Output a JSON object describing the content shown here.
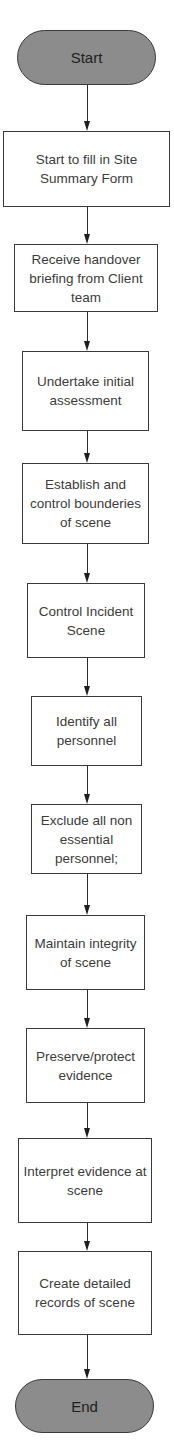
{
  "diagram": {
    "type": "flowchart",
    "direction": "top-to-bottom",
    "colors": {
      "terminator_fill": "#8c8c8c",
      "process_fill": "#ffffff",
      "stroke": "#3a3a3a",
      "text": "#3c3c3c"
    },
    "nodes": [
      {
        "id": "start",
        "shape": "terminator",
        "label": "Start"
      },
      {
        "id": "step1",
        "shape": "process",
        "label": "Start to fill in Site Summary Form"
      },
      {
        "id": "step2",
        "shape": "process",
        "label": "Receive handover briefing from Client team"
      },
      {
        "id": "step3",
        "shape": "process",
        "label": "Undertake initial assessment"
      },
      {
        "id": "step4",
        "shape": "process",
        "label": "Establish and control bounderies of scene"
      },
      {
        "id": "step5",
        "shape": "process",
        "label": "Control Incident Scene"
      },
      {
        "id": "step6",
        "shape": "process",
        "label": "Identify all personnel"
      },
      {
        "id": "step7",
        "shape": "process",
        "label": "Exclude all non essential personnel;"
      },
      {
        "id": "step8",
        "shape": "process",
        "label": "Maintain integrity of scene"
      },
      {
        "id": "step9",
        "shape": "process",
        "label": "Preserve/protect evidence"
      },
      {
        "id": "step10",
        "shape": "process",
        "label": "Interpret evidence at scene"
      },
      {
        "id": "step11",
        "shape": "process",
        "label": "Create detailed records of scene"
      },
      {
        "id": "end",
        "shape": "terminator",
        "label": "End"
      }
    ],
    "edges": [
      {
        "from": "start",
        "to": "step1"
      },
      {
        "from": "step1",
        "to": "step2"
      },
      {
        "from": "step2",
        "to": "step3"
      },
      {
        "from": "step3",
        "to": "step4"
      },
      {
        "from": "step4",
        "to": "step5"
      },
      {
        "from": "step5",
        "to": "step6"
      },
      {
        "from": "step6",
        "to": "step7"
      },
      {
        "from": "step7",
        "to": "step8"
      },
      {
        "from": "step8",
        "to": "step9"
      },
      {
        "from": "step9",
        "to": "step10"
      },
      {
        "from": "step10",
        "to": "step11"
      },
      {
        "from": "step11",
        "to": "end"
      }
    ]
  }
}
